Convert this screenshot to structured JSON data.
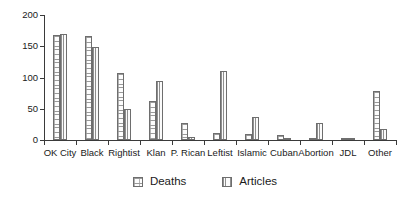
{
  "chart_data": {
    "type": "bar",
    "title": "",
    "subtitle": "",
    "xlabel": "",
    "ylabel": "",
    "ylim": [
      0,
      200
    ],
    "yticks": [
      0,
      50,
      100,
      150,
      200
    ],
    "grid": false,
    "legend_position": "bottom-center",
    "categories": [
      "OK City",
      "Black",
      "Rightist",
      "Klan",
      "P. Rican",
      "Leftist",
      "Islamic",
      "Cuban",
      "Abortion",
      "JDL",
      "Other"
    ],
    "series": [
      {
        "name": "Deaths",
        "pattern": "dot-grid-hatch",
        "values": [
          168,
          166,
          107,
          63,
          28,
          12,
          10,
          8,
          3,
          4,
          78
        ]
      },
      {
        "name": "Articles",
        "pattern": "vertical-line-hatch",
        "values": [
          170,
          149,
          50,
          95,
          5,
          110,
          37,
          2,
          28,
          3,
          17
        ]
      }
    ]
  },
  "axis": {
    "y_tick_labels": [
      "200",
      "150",
      "100",
      "50",
      "0"
    ],
    "x_tick_labels": [
      "OK City",
      "Black",
      "Rightist",
      "Klan",
      "P. Rican",
      "Leftist",
      "Islamic",
      "Cuban",
      "Abortion",
      "JDL",
      "Other"
    ]
  },
  "legend": {
    "items": [
      {
        "label": "Deaths",
        "swatch": "deaths-swatch-icon"
      },
      {
        "label": "Articles",
        "swatch": "articles-swatch-icon"
      }
    ]
  },
  "colors": {
    "axis": "#3a3a3a",
    "bar_outline": "#6e6e6e",
    "deaths_fill": "#fdfdfd",
    "articles_fill": "#fbfbfb",
    "text": "#1a1a1a",
    "background": "#ffffff"
  }
}
